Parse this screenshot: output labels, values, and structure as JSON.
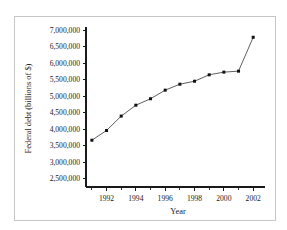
{
  "figure": {
    "caption_stub": "",
    "frame_color": "#c6c6c6",
    "background": "#ffffff"
  },
  "chart_data": {
    "type": "line",
    "title": "",
    "xlabel": "Year",
    "ylabel": "Federal debt (billions of $)",
    "x": [
      1991,
      1992,
      1993,
      1994,
      1995,
      1996,
      1997,
      1998,
      1999,
      2000,
      2001,
      2002
    ],
    "values": [
      3665000,
      3960000,
      4395000,
      4725000,
      4920000,
      5180000,
      5360000,
      5450000,
      5645000,
      5725000,
      5755000,
      6780000
    ],
    "xlim": [
      1990.6,
      2002.6
    ],
    "ylim": [
      2250000,
      7000000
    ],
    "xticks_major": [
      1992,
      1994,
      1996,
      1998,
      2000,
      2002
    ],
    "xticks_major_labels": [
      "1992",
      "1994",
      "1996",
      "1998",
      "2000",
      "2002"
    ],
    "xticks_minor": [
      1991,
      1993,
      1995,
      1997,
      1999,
      2001
    ],
    "yticks": [
      2500000,
      3000000,
      3500000,
      4000000,
      4500000,
      5000000,
      5500000,
      6000000,
      6500000,
      7000000
    ],
    "ytick_labels": [
      "2,500,000",
      "3,000,000",
      "3,500,000",
      "4,000,000",
      "4,500,000",
      "5,000,000",
      "5,500,000",
      "6,000,000",
      "6,500,000",
      "7,000,000"
    ],
    "grid": false,
    "legend": null,
    "line_color": "#4d4d4d",
    "marker_color": "#111111",
    "marker_shape": "square"
  }
}
